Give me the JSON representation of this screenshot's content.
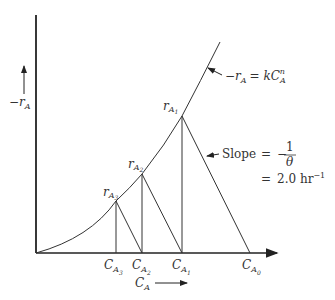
{
  "diagram": {
    "y_axis_label": "−r",
    "y_axis_label_sub": "A",
    "x_axis_label": "C",
    "x_axis_label_sub": "A",
    "curve_label": {
      "lhs": "−r",
      "lhs_sub": "A",
      "eq": "= kC",
      "eq_sub": "A",
      "eq_sup": "n"
    },
    "points": [
      {
        "label": "r",
        "sub": "A",
        "subsub": "1"
      },
      {
        "label": "r",
        "sub": "A",
        "subsub": "2"
      },
      {
        "label": "r",
        "sub": "A",
        "subsub": "3"
      }
    ],
    "x_ticks": [
      {
        "label": "C",
        "sub": "A",
        "subsub": "3"
      },
      {
        "label": "C",
        "sub": "A",
        "subsub": "2"
      },
      {
        "label": "C",
        "sub": "A",
        "subsub": "1"
      },
      {
        "label": "C",
        "sub": "A",
        "subsub": "0"
      }
    ],
    "slope": {
      "label": "Slope",
      "eq1": "=",
      "minus": "−",
      "numer": "1",
      "denom": "θ",
      "eq2": "=",
      "value": "2.0 hr",
      "value_sup": "−1"
    }
  }
}
